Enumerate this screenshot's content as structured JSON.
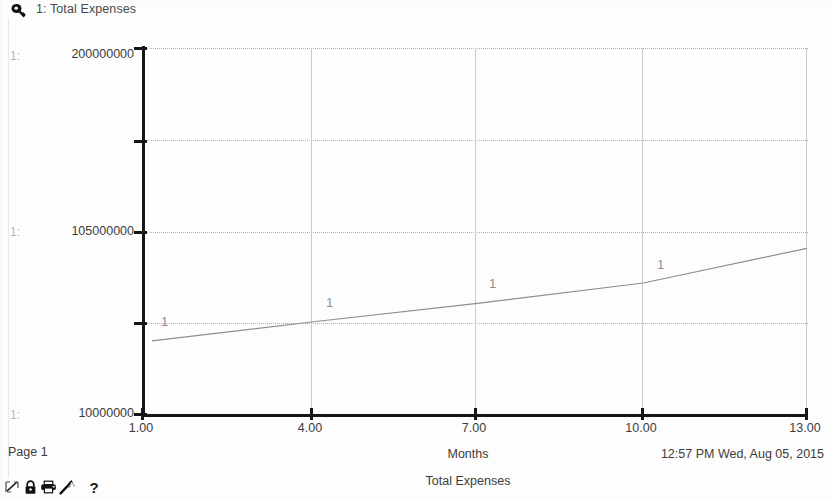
{
  "header": {
    "pin_icon": "pin-icon",
    "series_title": "1: Total Expenses"
  },
  "axis_index_labels": [
    "1:",
    "1:",
    "1:"
  ],
  "footer": {
    "page_label": "Page 1",
    "timestamp": "12:57 PM  Wed, Aug 05, 2015"
  },
  "toolbar": {
    "items": [
      {
        "name": "no-graph-icon",
        "glyph": "✕"
      },
      {
        "name": "lock-icon",
        "glyph": "a"
      },
      {
        "name": "printer-icon",
        "glyph": "⎙"
      },
      {
        "name": "wand-icon",
        "glyph": "✐"
      }
    ],
    "help_label": "?"
  },
  "chart_data": {
    "type": "line",
    "title": "Total Expenses",
    "xlabel": "Months",
    "ylabel": "",
    "series_label": "1: Total Expenses",
    "series_marker": "1",
    "x_ticks": [
      "1.00",
      "4.00",
      "7.00",
      "10.00",
      "13.00"
    ],
    "x_tick_values": [
      1,
      4,
      7,
      10,
      13
    ],
    "xlim": [
      1,
      13
    ],
    "y_ticks": [
      "200000000",
      "105000000",
      "10000000"
    ],
    "y_tick_values": [
      200000000,
      105000000,
      10000000
    ],
    "ylim": [
      10000000,
      200000000
    ],
    "grid": true,
    "grid_h_values": [
      200000000,
      152500000,
      105000000,
      57500000,
      10000000
    ],
    "legend": "1: Total Expenses",
    "series": [
      {
        "name": "1: Total Expenses",
        "x": [
          1,
          4,
          7,
          10,
          13
        ],
        "values": [
          48000000,
          58000000,
          67500000,
          78000000,
          96000000
        ],
        "marker_x": [
          1.15,
          2.35,
          3.5,
          4.8
        ],
        "color": "#8e8e8e"
      }
    ]
  },
  "colors": {
    "axis": "#161616",
    "grid_major": "#cacaca",
    "grid_dotted": "#b0b0b0",
    "line": "#8e8e8e",
    "text": "#3c3c3c",
    "muted_text": "#b9b9b9",
    "background": "#fdfdfd"
  }
}
